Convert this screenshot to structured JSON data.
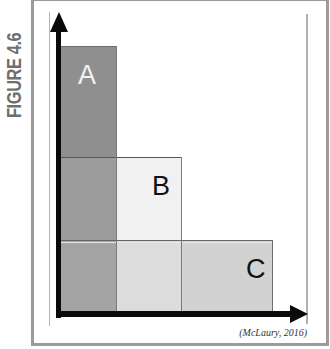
{
  "figure": {
    "label": "FIGURE 4.6",
    "citation": "(McLaury, 2016)"
  },
  "diagram": {
    "type": "nested-stacked-rectangles",
    "axes": {
      "x_arrow": true,
      "y_arrow": true,
      "x_label": "",
      "y_label": ""
    },
    "blocks": [
      {
        "id": "A",
        "label": "A",
        "color": "#8f8f8f",
        "label_color": "#f2f2f2",
        "x_range": [
          0,
          1
        ],
        "y_range": [
          0,
          3
        ]
      },
      {
        "id": "B",
        "label": "B",
        "color": "#efefef",
        "label_color": "#111111",
        "x_range": [
          0,
          2
        ],
        "y_range": [
          0,
          2
        ]
      },
      {
        "id": "C",
        "label": "C",
        "color": "#cfcfcf",
        "label_color": "#111111",
        "x_range": [
          0,
          4
        ],
        "y_range": [
          0,
          1
        ]
      }
    ]
  },
  "colors": {
    "frame": "#9a9a9a",
    "label_gray": "#6d6f70",
    "axis": "#0a0a0a"
  }
}
